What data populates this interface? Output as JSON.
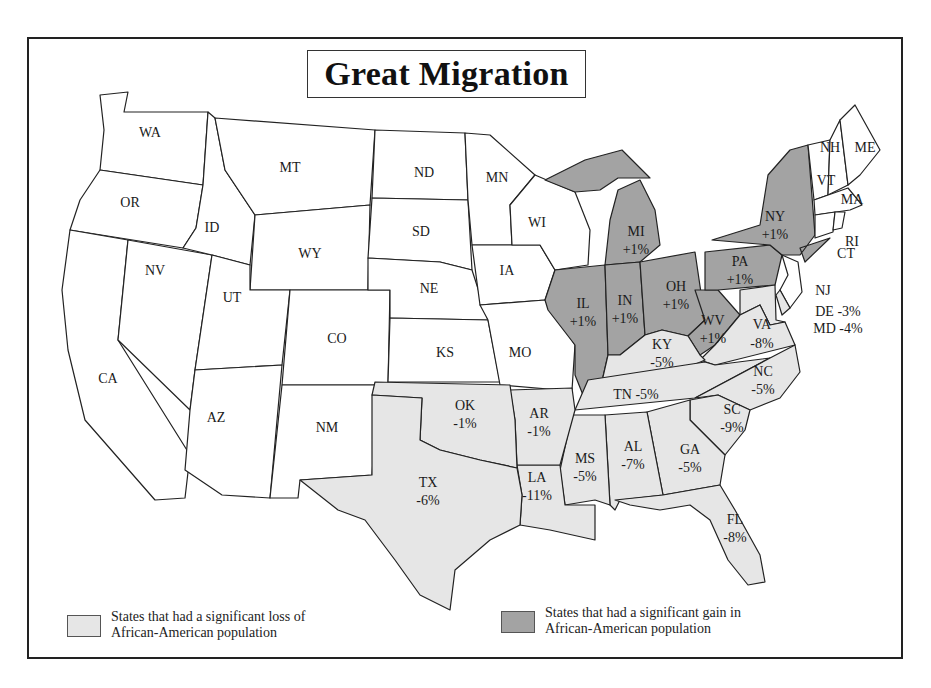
{
  "title": "Great Migration",
  "colors": {
    "loss": "#e6e6e6",
    "gain": "#a3a3a3",
    "none": "#ffffff",
    "border": "#222222"
  },
  "legend": {
    "loss": {
      "line1": "States that had a significant loss of",
      "line2": "African-American population"
    },
    "gain": {
      "line1": "States that had a significant gain in",
      "line2": "African-American population"
    }
  },
  "states": {
    "WA": {
      "label": "WA",
      "change": ""
    },
    "OR": {
      "label": "OR",
      "change": ""
    },
    "CA": {
      "label": "CA",
      "change": ""
    },
    "ID": {
      "label": "ID",
      "change": ""
    },
    "NV": {
      "label": "NV",
      "change": ""
    },
    "MT": {
      "label": "MT",
      "change": ""
    },
    "WY": {
      "label": "WY",
      "change": ""
    },
    "UT": {
      "label": "UT",
      "change": ""
    },
    "AZ": {
      "label": "AZ",
      "change": ""
    },
    "CO": {
      "label": "CO",
      "change": ""
    },
    "NM": {
      "label": "NM",
      "change": ""
    },
    "ND": {
      "label": "ND",
      "change": ""
    },
    "SD": {
      "label": "SD",
      "change": ""
    },
    "NE": {
      "label": "NE",
      "change": ""
    },
    "KS": {
      "label": "KS",
      "change": ""
    },
    "MN": {
      "label": "MN",
      "change": ""
    },
    "IA": {
      "label": "IA",
      "change": ""
    },
    "MO": {
      "label": "MO",
      "change": ""
    },
    "WI": {
      "label": "WI",
      "change": ""
    },
    "ME": {
      "label": "ME",
      "change": ""
    },
    "NH": {
      "label": "NH",
      "change": ""
    },
    "VT": {
      "label": "VT",
      "change": ""
    },
    "MA": {
      "label": "MA",
      "change": ""
    },
    "RI": {
      "label": "RI",
      "change": ""
    },
    "CT": {
      "label": "CT",
      "change": ""
    },
    "NJ": {
      "label": "NJ",
      "change": ""
    },
    "MI": {
      "label": "MI",
      "change": "+1%"
    },
    "IL": {
      "label": "IL",
      "change": "+1%"
    },
    "IN": {
      "label": "IN",
      "change": "+1%"
    },
    "OH": {
      "label": "OH",
      "change": "+1%"
    },
    "PA": {
      "label": "PA",
      "change": "+1%"
    },
    "NY": {
      "label": "NY",
      "change": "+1%"
    },
    "WV": {
      "label": "WV",
      "change": "+1%"
    },
    "DE": {
      "label": "DE -3%",
      "change": "-3%"
    },
    "MD": {
      "label": "MD -4%",
      "change": "-4%"
    },
    "VA": {
      "label": "VA",
      "change": "-8%"
    },
    "KY": {
      "label": "KY",
      "change": "-5%"
    },
    "TN": {
      "label": "TN -5%",
      "change": "-5%"
    },
    "NC": {
      "label": "NC",
      "change": "-5%"
    },
    "SC": {
      "label": "SC",
      "change": "-9%"
    },
    "GA": {
      "label": "GA",
      "change": "-5%"
    },
    "FL": {
      "label": "FL",
      "change": "-8%"
    },
    "AL": {
      "label": "AL",
      "change": "-7%"
    },
    "MS": {
      "label": "MS",
      "change": "-5%"
    },
    "LA": {
      "label": "LA",
      "change": "-11%"
    },
    "AR": {
      "label": "AR",
      "change": "-1%"
    },
    "OK": {
      "label": "OK",
      "change": "-1%"
    },
    "TX": {
      "label": "TX",
      "change": "-6%"
    }
  }
}
